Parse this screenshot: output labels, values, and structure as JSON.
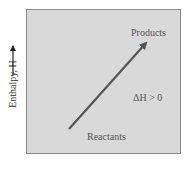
{
  "diagram": {
    "y_axis_label": "Enthalpy, H",
    "y_axis_direction": "up-arrow",
    "products_label": "Products",
    "reactants_label": "Reactants",
    "delta_label": "ΔH > 0",
    "colors": {
      "panel_fill": "#d9d9d9",
      "panel_border": "#8a8a8a",
      "arrow": "#555555",
      "text": "#555555"
    }
  }
}
